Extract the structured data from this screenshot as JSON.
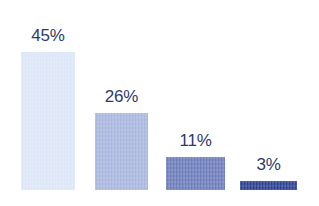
{
  "chart_data": {
    "type": "bar",
    "title": "",
    "subtitle": "",
    "xlabel": "",
    "ylabel": "",
    "categories": [
      "",
      "",
      "",
      ""
    ],
    "values": [
      45,
      26,
      11,
      3
    ],
    "value_labels": [
      "45%",
      "26%",
      "11%",
      "3%"
    ],
    "ylim": [
      0,
      50
    ],
    "grid": false,
    "legend": "none",
    "orientation": "vertical",
    "bar_colors": [
      "#dce6f7",
      "#a8b6de",
      "#6b7cba",
      "#2b3f91"
    ],
    "label_color": "#2e3a6b",
    "background_color": "#ffffff",
    "bars": [
      {
        "label": "45%",
        "value": 45,
        "color": "#dce6f7",
        "left_px": 21,
        "width_px": 54,
        "height_px": 138,
        "label_top_px": 27
      },
      {
        "label": "26%",
        "value": 26,
        "color": "#a8b6de",
        "left_px": 95,
        "width_px": 53,
        "height_px": 77,
        "label_top_px": 88
      },
      {
        "label": "11%",
        "value": 11,
        "color": "#6b7cba",
        "left_px": 166,
        "width_px": 59,
        "height_px": 33,
        "label_top_px": 132
      },
      {
        "label": "3%",
        "value": 3,
        "color": "#2b3f91",
        "left_px": 240,
        "width_px": 57,
        "height_px": 9,
        "label_top_px": 156
      }
    ]
  }
}
